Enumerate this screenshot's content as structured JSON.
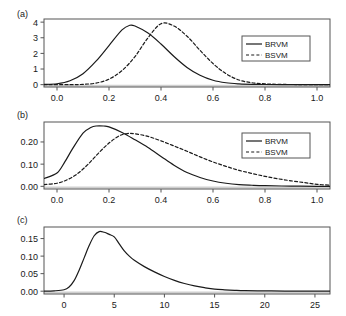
{
  "figure": {
    "panels": [
      {
        "label": "(a)",
        "legend": {
          "entries": [
            {
              "name": "BRVM",
              "style": "solid"
            },
            {
              "name": "BSVM",
              "style": "dashed"
            }
          ]
        },
        "xticks": [
          "0.0",
          "0.2",
          "0.4",
          "0.6",
          "0.8",
          "1.0"
        ],
        "yticks": [
          "0",
          "1",
          "2",
          "3",
          "4"
        ]
      },
      {
        "label": "(b)",
        "legend": {
          "entries": [
            {
              "name": "BRVM",
              "style": "solid"
            },
            {
              "name": "BSVM",
              "style": "dashed"
            }
          ]
        },
        "xticks": [
          "0.0",
          "0.2",
          "0.4",
          "0.6",
          "0.8",
          "1.0"
        ],
        "yticks": [
          "0.00",
          "0.10",
          "0.20"
        ]
      },
      {
        "label": "(c)",
        "xticks": [
          "0",
          "5",
          "10",
          "15",
          "20",
          "25"
        ],
        "yticks": [
          "0.00",
          "0.05",
          "0.10",
          "0.15"
        ]
      }
    ]
  },
  "chart_data": [
    {
      "type": "line",
      "title": "(a)",
      "xlabel": "",
      "ylabel": "",
      "xlim": [
        -0.05,
        1.05
      ],
      "ylim": [
        -0.15,
        4.2
      ],
      "xticks": [
        0.0,
        0.2,
        0.4,
        0.6,
        0.8,
        1.0
      ],
      "yticks": [
        0,
        1,
        2,
        3,
        4
      ],
      "grid": false,
      "legend_position": "right",
      "series": [
        {
          "name": "BRVM",
          "style": "solid",
          "color": "#1a1a1a",
          "x": [
            -0.05,
            0.0,
            0.05,
            0.1,
            0.15,
            0.2,
            0.25,
            0.28,
            0.3,
            0.35,
            0.4,
            0.45,
            0.5,
            0.55,
            0.6,
            0.65,
            0.7,
            0.75,
            0.8,
            0.9,
            1.0,
            1.05
          ],
          "y": [
            0.02,
            0.06,
            0.25,
            0.7,
            1.5,
            2.5,
            3.5,
            3.8,
            3.75,
            3.3,
            2.6,
            1.8,
            1.1,
            0.6,
            0.28,
            0.12,
            0.05,
            0.02,
            0.01,
            0.0,
            0.0,
            0.0
          ]
        },
        {
          "name": "BSVM",
          "style": "dashed",
          "color": "#1a1a1a",
          "x": [
            -0.05,
            0.05,
            0.1,
            0.15,
            0.2,
            0.25,
            0.3,
            0.35,
            0.4,
            0.45,
            0.5,
            0.55,
            0.6,
            0.65,
            0.7,
            0.75,
            0.8,
            0.85,
            0.9,
            1.0,
            1.05
          ],
          "y": [
            0.0,
            0.0,
            0.02,
            0.1,
            0.35,
            0.9,
            1.8,
            3.0,
            3.9,
            3.75,
            3.1,
            2.2,
            1.35,
            0.7,
            0.3,
            0.12,
            0.05,
            0.02,
            0.01,
            0.0,
            0.0
          ]
        }
      ]
    },
    {
      "type": "line",
      "title": "(b)",
      "xlabel": "",
      "ylabel": "",
      "xlim": [
        -0.05,
        1.05
      ],
      "ylim": [
        -0.012,
        0.29
      ],
      "xticks": [
        0.0,
        0.2,
        0.4,
        0.6,
        0.8,
        1.0
      ],
      "yticks": [
        0.0,
        0.1,
        0.2
      ],
      "grid": false,
      "legend_position": "right",
      "series": [
        {
          "name": "BRVM",
          "style": "solid",
          "color": "#1a1a1a",
          "x": [
            -0.05,
            0.0,
            0.03,
            0.06,
            0.1,
            0.13,
            0.15,
            0.18,
            0.2,
            0.25,
            0.3,
            0.35,
            0.4,
            0.45,
            0.5,
            0.55,
            0.6,
            0.65,
            0.7,
            0.75,
            0.8,
            0.9,
            1.0,
            1.05
          ],
          "y": [
            0.035,
            0.06,
            0.11,
            0.17,
            0.24,
            0.265,
            0.272,
            0.272,
            0.268,
            0.243,
            0.21,
            0.175,
            0.135,
            0.095,
            0.062,
            0.04,
            0.024,
            0.014,
            0.008,
            0.005,
            0.003,
            0.001,
            0.0,
            0.0
          ]
        },
        {
          "name": "BSVM",
          "style": "dashed",
          "color": "#1a1a1a",
          "x": [
            -0.05,
            0.0,
            0.04,
            0.08,
            0.12,
            0.16,
            0.2,
            0.24,
            0.27,
            0.3,
            0.35,
            0.4,
            0.45,
            0.5,
            0.55,
            0.6,
            0.65,
            0.7,
            0.75,
            0.8,
            0.85,
            0.9,
            0.95,
            1.0,
            1.05
          ],
          "y": [
            0.008,
            0.014,
            0.03,
            0.058,
            0.1,
            0.15,
            0.195,
            0.228,
            0.238,
            0.237,
            0.225,
            0.205,
            0.182,
            0.158,
            0.133,
            0.11,
            0.09,
            0.072,
            0.058,
            0.045,
            0.034,
            0.025,
            0.017,
            0.009,
            0.005
          ]
        }
      ]
    },
    {
      "type": "line",
      "title": "(c)",
      "xlabel": "",
      "ylabel": "",
      "xlim": [
        -2.0,
        26.5
      ],
      "ylim": [
        -0.008,
        0.183
      ],
      "xticks": [
        0,
        5,
        10,
        15,
        20,
        25
      ],
      "yticks": [
        0.0,
        0.05,
        0.1,
        0.15
      ],
      "grid": false,
      "series": [
        {
          "name": "density",
          "style": "solid",
          "color": "#1a1a1a",
          "x": [
            -2.0,
            -1.0,
            0.0,
            0.5,
            1.0,
            1.5,
            2.0,
            2.5,
            3.0,
            3.5,
            4.0,
            4.5,
            5.0,
            5.5,
            6.0,
            6.5,
            7.0,
            8.0,
            9.0,
            10.0,
            11.0,
            12.0,
            13.0,
            14.0,
            15.0,
            16.0,
            17.0,
            18.0,
            20.0,
            22.0,
            25.0,
            26.5
          ],
          "y": [
            0.0,
            0.001,
            0.004,
            0.012,
            0.03,
            0.06,
            0.095,
            0.13,
            0.158,
            0.17,
            0.168,
            0.162,
            0.155,
            0.135,
            0.115,
            0.1,
            0.088,
            0.07,
            0.055,
            0.042,
            0.031,
            0.022,
            0.015,
            0.01,
            0.006,
            0.004,
            0.0025,
            0.0015,
            0.0008,
            0.0004,
            0.0001,
            0.0
          ]
        }
      ]
    }
  ]
}
